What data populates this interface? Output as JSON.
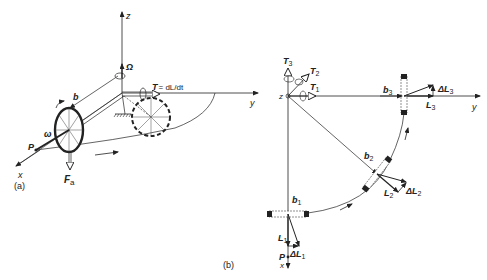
{
  "panel_a": {
    "caption": "(a)",
    "axes": {
      "x": "x",
      "y": "y",
      "z": "z"
    },
    "labels": {
      "omega_big": "Ω",
      "b": "b",
      "torque": "T",
      "torque_eq": "= dL/dt",
      "omega": "ω",
      "P": "P",
      "F": "F",
      "F_sub": "a"
    }
  },
  "panel_b": {
    "caption": "(b)",
    "axes": {
      "x": "x",
      "y": "y",
      "z": "z"
    },
    "labels": {
      "T1": "T",
      "T1_sub": "1",
      "T2": "T",
      "T2_sub": "2",
      "T3": "T",
      "T3_sub": "3",
      "b1": "b",
      "b1_sub": "1",
      "b2": "b",
      "b2_sub": "2",
      "b3": "b",
      "b3_sub": "3",
      "L1": "L",
      "L1_sub": "1",
      "L2": "L",
      "L2_sub": "2",
      "L3": "L",
      "L3_sub": "3",
      "dL1": "ΔL",
      "dL1_sub": "1",
      "dL2": "ΔL",
      "dL2_sub": "2",
      "dL3": "ΔL",
      "dL3_sub": "3",
      "P": "P"
    }
  }
}
